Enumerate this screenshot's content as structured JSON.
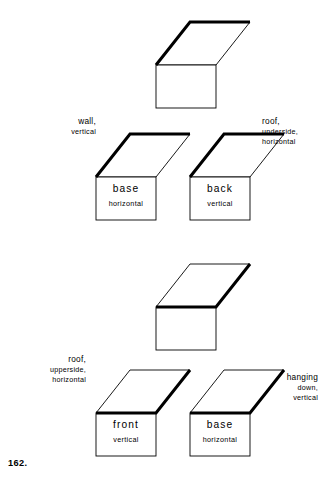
{
  "figure": {
    "number": "162."
  },
  "shapes": [
    {
      "id": "row1-single",
      "bold_edge": "far",
      "face_label": {
        "name": "",
        "orient": ""
      }
    },
    {
      "id": "row2-left",
      "bold_edge": "far",
      "face_label": {
        "name": "base",
        "orient": "horizontal"
      }
    },
    {
      "id": "row2-right",
      "bold_edge": "far",
      "face_label": {
        "name": "back",
        "orient": "vertical"
      }
    },
    {
      "id": "row3-single",
      "bold_edge": "near",
      "face_label": {
        "name": "",
        "orient": ""
      }
    },
    {
      "id": "row4-left",
      "bold_edge": "near",
      "face_label": {
        "name": "front",
        "orient": "vertical"
      }
    },
    {
      "id": "row4-right",
      "bold_edge": "near",
      "face_label": {
        "name": "base",
        "orient": "horizontal"
      }
    }
  ],
  "annotations": {
    "wall": {
      "line1": "wall,",
      "line2": "vertical"
    },
    "roof_underside": {
      "line1": "roof,",
      "line2": "underside,",
      "line3": "horizontal"
    },
    "roof_upperside": {
      "line1": "roof,",
      "line2": "upperside,",
      "line3": "horizontal"
    },
    "hanging_down": {
      "line1": "hanging",
      "line2": "down,",
      "line3": "vertical"
    }
  },
  "style": {
    "ink": "#000000",
    "paper": "#ffffff",
    "thin_stroke": "0.9",
    "bold_stroke": "3.0"
  }
}
